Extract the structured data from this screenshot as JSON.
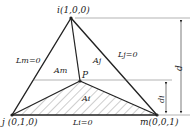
{
  "vertices": {
    "i": {
      "label": "i(1,0,0)",
      "x": 71,
      "y": 18
    },
    "j": {
      "label": "j (0,1,0)",
      "x": 12,
      "y": 115
    },
    "m": {
      "label": "m(0,0,1)",
      "x": 157,
      "y": 115
    },
    "P": {
      "label": "P",
      "x": 80,
      "y": 81
    }
  },
  "lines": {
    "Lm": "Lm=0",
    "Lj": "Lj=0",
    "Li": "Li=0"
  },
  "areas": {
    "Am": "Am",
    "Aj": "Aj",
    "Ai": "Ai"
  },
  "dimensions": {
    "d": "d",
    "di": "di"
  },
  "colors": {
    "stroke": "#222222",
    "hatch": "#555555",
    "thin": "#666666"
  }
}
